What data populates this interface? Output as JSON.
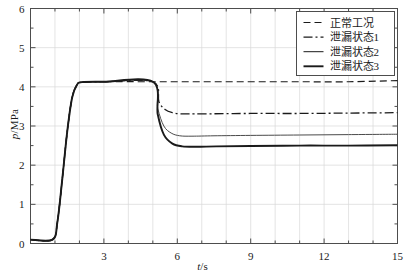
{
  "chart_data": {
    "type": "line",
    "title": "",
    "xlabel": "t/s",
    "ylabel": "p/MPa",
    "xlim": [
      0,
      15
    ],
    "ylim": [
      0,
      6
    ],
    "xticks": [
      3,
      6,
      9,
      12,
      15
    ],
    "yticks": [
      0,
      1,
      2,
      3,
      4,
      5,
      6
    ],
    "xtick_labels": [
      "3",
      "6",
      "9",
      "12",
      "15"
    ],
    "ytick_labels": [
      "0",
      "1",
      "2",
      "3",
      "4",
      "5",
      "6"
    ],
    "x_minor_step": 1,
    "y_minor_step": 0.5,
    "grid": true,
    "legend_position": "top-right",
    "initial_pressure": 0.1,
    "pressurize_start_s": 0.9,
    "steady_reached_s": 2.0,
    "plateau_pressure": 4.13,
    "event_time_s": 5.0,
    "series": [
      {
        "name": "正常工况",
        "style": "dashed",
        "width": 1.2,
        "color": "#1a1a1a",
        "final_value": 4.13,
        "x": [
          0,
          0.9,
          1.1,
          1.3,
          1.5,
          1.7,
          1.9,
          2.1,
          3,
          5,
          7,
          9,
          11,
          13,
          15
        ],
        "y": [
          0.1,
          0.1,
          0.55,
          1.65,
          2.85,
          3.72,
          4.05,
          4.12,
          4.13,
          4.13,
          4.13,
          4.13,
          4.13,
          4.13,
          4.16
        ]
      },
      {
        "name": "泄漏状态1",
        "style": "dashdot",
        "width": 1.3,
        "color": "#1a1a1a",
        "final_value": 3.33,
        "x": [
          0,
          0.9,
          1.1,
          1.3,
          1.5,
          1.7,
          1.9,
          2.1,
          3,
          5,
          5.25,
          5.5,
          5.8,
          6.2,
          7,
          9,
          11,
          13,
          15
        ],
        "y": [
          0.1,
          0.1,
          0.55,
          1.65,
          2.85,
          3.72,
          4.05,
          4.12,
          4.13,
          4.13,
          3.62,
          3.42,
          3.34,
          3.31,
          3.31,
          3.32,
          3.32,
          3.33,
          3.34
        ]
      },
      {
        "name": "泄漏状态2",
        "style": "solid",
        "width": 1.0,
        "color": "#4a4a4a",
        "final_value": 2.79,
        "x": [
          0,
          0.9,
          1.1,
          1.3,
          1.5,
          1.7,
          1.9,
          2.1,
          3,
          5,
          5.2,
          5.45,
          5.75,
          6.1,
          6.6,
          7.5,
          9,
          11,
          13,
          15
        ],
        "y": [
          0.1,
          0.1,
          0.55,
          1.65,
          2.85,
          3.72,
          4.05,
          4.12,
          4.13,
          4.13,
          3.45,
          3.0,
          2.82,
          2.75,
          2.74,
          2.75,
          2.76,
          2.77,
          2.78,
          2.79
        ]
      },
      {
        "name": "泄漏状态3",
        "style": "solid",
        "width": 1.9,
        "color": "#1a1a1a",
        "final_value": 2.51,
        "x": [
          0,
          0.9,
          1.1,
          1.3,
          1.5,
          1.7,
          1.9,
          2.1,
          3,
          5,
          5.2,
          5.45,
          5.8,
          6.2,
          6.8,
          7.6,
          9,
          11,
          13,
          15
        ],
        "y": [
          0.1,
          0.1,
          0.55,
          1.65,
          2.85,
          3.72,
          4.05,
          4.12,
          4.13,
          4.13,
          3.3,
          2.78,
          2.55,
          2.48,
          2.47,
          2.48,
          2.49,
          2.5,
          2.5,
          2.51
        ]
      }
    ],
    "legend": [
      {
        "label": "正常工况",
        "style": "dashed"
      },
      {
        "label": "泄漏状态1",
        "style": "dashdot"
      },
      {
        "label": "泄漏状态2",
        "style": "solid-thin"
      },
      {
        "label": "泄漏状态3",
        "style": "solid-thick"
      }
    ],
    "colors": {
      "axis": "#4d4d4d",
      "grid": "#d9d9d9",
      "curve_dark": "#1a1a1a",
      "curve_gray": "#4a4a4a",
      "background": "#ffffff"
    }
  }
}
